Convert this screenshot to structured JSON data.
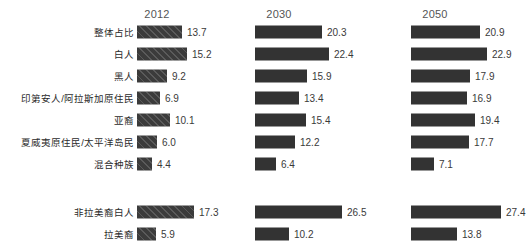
{
  "chart_data": {
    "type": "bar",
    "title": "",
    "subtitle": "",
    "xlabel": "",
    "ylabel": "",
    "orientation": "horizontal",
    "grid": false,
    "legend_position": "none",
    "axis_range": [
      0,
      30
    ],
    "px_per_unit": 3.3,
    "columns": [
      {
        "label": "2012",
        "hatched": true
      },
      {
        "label": "2030",
        "hatched": false
      },
      {
        "label": "2050",
        "hatched": false
      }
    ],
    "groups": [
      {
        "name": "race-group",
        "categories": [
          "整体占比",
          "白人",
          "黑人",
          "印第安人/阿拉斯加原住民",
          "亚裔",
          "夏威夷原住民/太平洋岛民",
          "混合种族"
        ],
        "series": [
          {
            "name": "2012",
            "values": [
              13.7,
              15.2,
              9.2,
              6.9,
              10.1,
              6.0,
              4.4
            ]
          },
          {
            "name": "2030",
            "values": [
              20.3,
              22.4,
              15.9,
              13.4,
              15.4,
              12.2,
              6.4
            ]
          },
          {
            "name": "2050",
            "values": [
              20.9,
              22.9,
              17.9,
              16.9,
              19.4,
              17.7,
              7.1
            ]
          }
        ]
      },
      {
        "name": "ethnicity-group",
        "categories": [
          "非拉美裔白人",
          "拉美裔"
        ],
        "series": [
          {
            "name": "2012",
            "values": [
              17.3,
              5.9
            ]
          },
          {
            "name": "2030",
            "values": [
              26.5,
              10.2
            ]
          },
          {
            "name": "2050",
            "values": [
              27.4,
              13.8
            ]
          }
        ]
      }
    ],
    "colors": {
      "bar": "#333333",
      "bar_hatched": "#3b3b3b",
      "text": "#3a3a3a",
      "header": "#555555",
      "background": "#ffffff"
    }
  }
}
